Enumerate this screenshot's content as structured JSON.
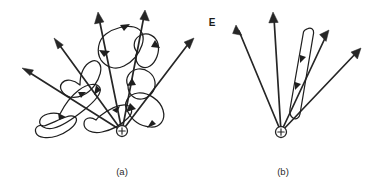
{
  "figure": {
    "background_color": "#ffffff",
    "ink_color": "#262626",
    "field_label": {
      "text": "E",
      "x": 212,
      "y": 26
    },
    "panels": [
      {
        "id": "a",
        "caption": "(a)",
        "caption_x": 122,
        "caption_y": 175,
        "charge": {
          "symbol": "+",
          "x": 122,
          "y": 131,
          "radius": 5.5,
          "polarity": "positive"
        },
        "description": "point charge with radial field lines and irregular closed loops",
        "rays": [
          {
            "name": "ray-1",
            "x1": 122,
            "y1": 131,
            "x2": 22,
            "y2": 68,
            "angle_deg": 148
          },
          {
            "name": "ray-2",
            "x1": 122,
            "y1": 131,
            "x2": 54,
            "y2": 38,
            "angle_deg": 126
          },
          {
            "name": "ray-3",
            "x1": 122,
            "y1": 131,
            "x2": 98,
            "y2": 12,
            "angle_deg": 101
          },
          {
            "name": "ray-4",
            "x1": 122,
            "y1": 131,
            "x2": 145,
            "y2": 10,
            "angle_deg": 79
          },
          {
            "name": "ray-5",
            "x1": 122,
            "y1": 131,
            "x2": 194,
            "y2": 38,
            "angle_deg": 52
          }
        ],
        "loop_count": 4
      },
      {
        "id": "b",
        "caption": "(b)",
        "caption_x": 283,
        "caption_y": 175,
        "charge": {
          "symbol": "+",
          "x": 281,
          "y": 132,
          "radius": 5.5,
          "polarity": "positive"
        },
        "description": "point charge with radial field lines and one narrow elongated loop",
        "rays": [
          {
            "name": "ray-1",
            "x1": 281,
            "y1": 132,
            "x2": 236,
            "y2": 25,
            "angle_deg": 113
          },
          {
            "name": "ray-2",
            "x1": 281,
            "y1": 132,
            "x2": 273,
            "y2": 12,
            "angle_deg": 94
          },
          {
            "name": "ray-3",
            "x1": 281,
            "y1": 132,
            "x2": 329,
            "y2": 30,
            "angle_deg": 65
          },
          {
            "name": "ray-4",
            "x1": 281,
            "y1": 132,
            "x2": 361,
            "y2": 48,
            "angle_deg": 46
          }
        ],
        "loop_count": 1
      }
    ]
  }
}
